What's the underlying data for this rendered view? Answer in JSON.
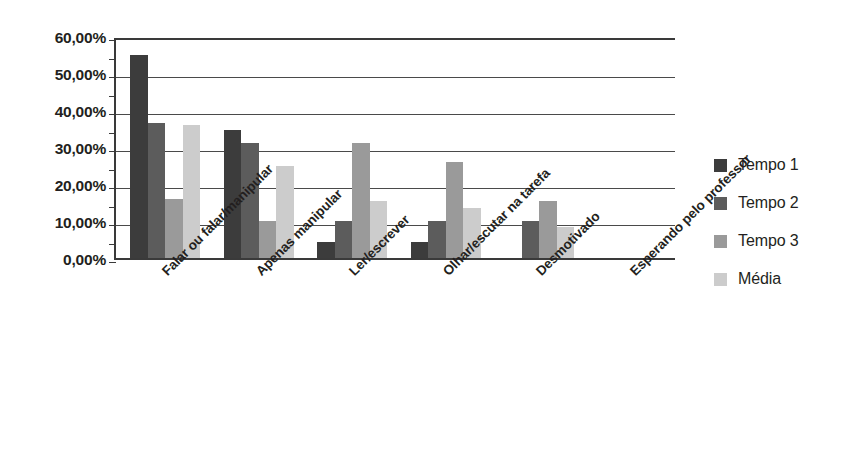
{
  "chart_data": {
    "type": "bar",
    "title": "",
    "xlabel": "",
    "ylabel": "",
    "ylim": [
      0,
      60
    ],
    "ytick_step": 10,
    "grid": true,
    "legend_position": "right",
    "ytick_labels": [
      "60,00%",
      "50,00%",
      "40,00%",
      "30,00%",
      "20,00%",
      "10,00%",
      "0,00%"
    ],
    "ytick_values": [
      60,
      50,
      40,
      30,
      20,
      10,
      0
    ],
    "categories": [
      "Falar ou falar/manipular",
      "Apenas manipular",
      "Ler/escrever",
      "Olhar/escutar na tarefa",
      "Desmotivado",
      "Esperando pelo professor"
    ],
    "series": [
      {
        "name": "Tempo 1",
        "color": "#3c3c3c",
        "values": [
          55.0,
          34.5,
          4.3,
          4.3,
          0.0,
          0.0
        ]
      },
      {
        "name": "Tempo 2",
        "color": "#5c5c5c",
        "values": [
          36.5,
          31.0,
          10.0,
          10.0,
          10.0,
          0.0
        ]
      },
      {
        "name": "Tempo 3",
        "color": "#9a9a9a",
        "values": [
          16.0,
          10.0,
          31.0,
          26.0,
          15.5,
          0.0
        ]
      },
      {
        "name": "Média",
        "color": "#cccccc",
        "values": [
          36.0,
          25.0,
          15.5,
          13.5,
          8.5,
          0.0
        ]
      }
    ]
  },
  "legend": {
    "items": [
      {
        "label": "Tempo 1",
        "color": "#3c3c3c"
      },
      {
        "label": "Tempo 2",
        "color": "#5c5c5c"
      },
      {
        "label": "Tempo 3",
        "color": "#9a9a9a"
      },
      {
        "label": "Média",
        "color": "#cccccc"
      }
    ]
  }
}
